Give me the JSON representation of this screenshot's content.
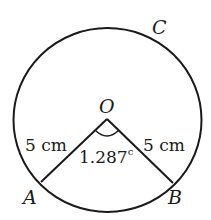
{
  "diagram": {
    "type": "circle-sector",
    "stroke_color": "#1a1a1a",
    "background": "#ffffff",
    "points": {
      "center": {
        "label": "O",
        "x": 107,
        "y": 119
      },
      "A": {
        "label": "A",
        "x": 40,
        "y": 183
      },
      "B": {
        "label": "B",
        "x": 173,
        "y": 183
      },
      "C": {
        "label": "C"
      }
    },
    "circle": {
      "cx": 107,
      "cy": 120,
      "r": 93
    },
    "labels": {
      "radius_OA": "5 cm",
      "radius_OB": "5 cm",
      "angle_AOB": "1.287",
      "angle_unit_superscript": "c"
    }
  }
}
